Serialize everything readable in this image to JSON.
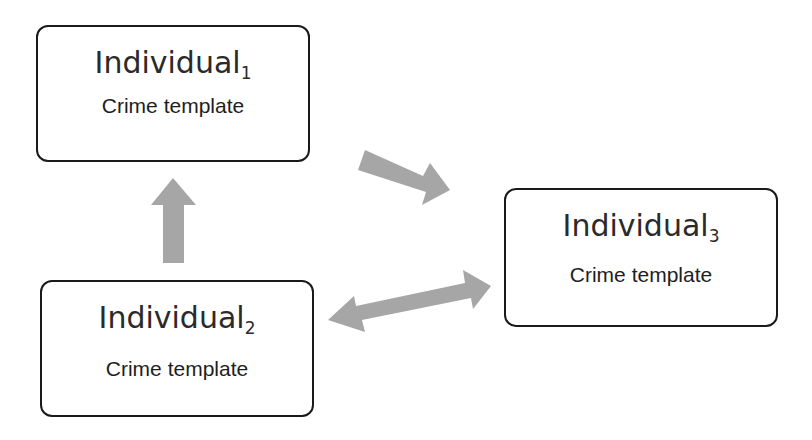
{
  "diagram": {
    "nodes": [
      {
        "id": "individual-1",
        "title": "Individual",
        "subscript": "1",
        "label": "Crime template"
      },
      {
        "id": "individual-2",
        "title": "Individual",
        "subscript": "2",
        "label": "Crime template"
      },
      {
        "id": "individual-3",
        "title": "Individual",
        "subscript": "3",
        "label": "Crime template"
      }
    ],
    "edges": [
      {
        "from": "individual-2",
        "to": "individual-1",
        "direction": "one-way"
      },
      {
        "from": "individual-1",
        "to": "individual-3",
        "direction": "one-way"
      },
      {
        "from": "individual-2",
        "to": "individual-3",
        "direction": "two-way"
      }
    ],
    "colors": {
      "arrow": "#a6a6a6",
      "box_border": "#1a1a1a",
      "background": "#ffffff"
    }
  }
}
